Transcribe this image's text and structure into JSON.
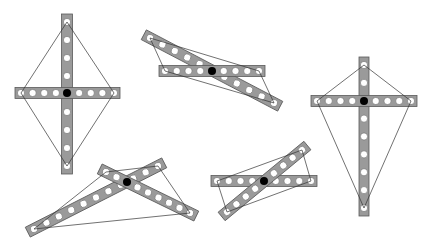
{
  "diagram": {
    "colors": {
      "bar": "#9a9a9a",
      "bar_stroke": "#5a5a5a",
      "hole": "#ffffff",
      "pivot": "#000000",
      "string": "#333333",
      "background": "#ffffff"
    },
    "figures": [
      {
        "id": "kite-symmetric",
        "pivot": [
          67,
          93
        ],
        "bars": [
          {
            "from": [
              67,
              22
            ],
            "to": [
              67,
              166
            ],
            "holes": 9,
            "width": 11,
            "pad": 8
          },
          {
            "from": [
              21,
              93
            ],
            "to": [
              114,
              93
            ],
            "holes": 9,
            "width": 11,
            "pad": 6
          }
        ],
        "string": [
          [
            67,
            22
          ],
          [
            21,
            93
          ],
          [
            67,
            166
          ],
          [
            114,
            93
          ]
        ]
      },
      {
        "id": "flat-crossed",
        "pivot": [
          212,
          71
        ],
        "bars": [
          {
            "from": [
              150,
              38
            ],
            "to": [
              274,
              103
            ],
            "holes": 11,
            "width": 11,
            "pad": 7
          },
          {
            "from": [
              165,
              71
            ],
            "to": [
              259,
              71
            ],
            "holes": 9,
            "width": 11,
            "pad": 6
          }
        ],
        "string": [
          [
            150,
            38
          ],
          [
            165,
            71
          ],
          [
            274,
            103
          ],
          [
            259,
            71
          ]
        ]
      },
      {
        "id": "kite-elongated",
        "pivot": [
          364,
          101
        ],
        "bars": [
          {
            "from": [
              364,
              65
            ],
            "to": [
              364,
              208
            ],
            "holes": 9,
            "width": 10,
            "pad": 8
          },
          {
            "from": [
              317,
              101
            ],
            "to": [
              411,
              101
            ],
            "holes": 9,
            "width": 11,
            "pad": 6
          }
        ],
        "string": [
          [
            364,
            65
          ],
          [
            317,
            101
          ],
          [
            364,
            208
          ],
          [
            411,
            101
          ]
        ]
      },
      {
        "id": "scissor-wide",
        "pivot": [
          127,
          182
        ],
        "bars": [
          {
            "from": [
              34,
              229
            ],
            "to": [
              158,
              166
            ],
            "holes": 11,
            "width": 11,
            "pad": 7
          },
          {
            "from": [
              106,
              172
            ],
            "to": [
              190,
              213
            ],
            "holes": 9,
            "width": 11,
            "pad": 7
          }
        ],
        "string": [
          [
            34,
            229
          ],
          [
            106,
            172
          ],
          [
            158,
            166
          ],
          [
            190,
            213
          ]
        ]
      },
      {
        "id": "tilted-crossed",
        "pivot": [
          264,
          181
        ],
        "bars": [
          {
            "from": [
              217,
              181
            ],
            "to": [
              311,
              181
            ],
            "holes": 9,
            "width": 11,
            "pad": 6
          },
          {
            "from": [
              227,
              212
            ],
            "to": [
              302,
              150
            ],
            "holes": 9,
            "width": 11,
            "pad": 7
          }
        ],
        "string": [
          [
            227,
            212
          ],
          [
            217,
            181
          ],
          [
            302,
            150
          ],
          [
            311,
            181
          ]
        ]
      }
    ]
  }
}
